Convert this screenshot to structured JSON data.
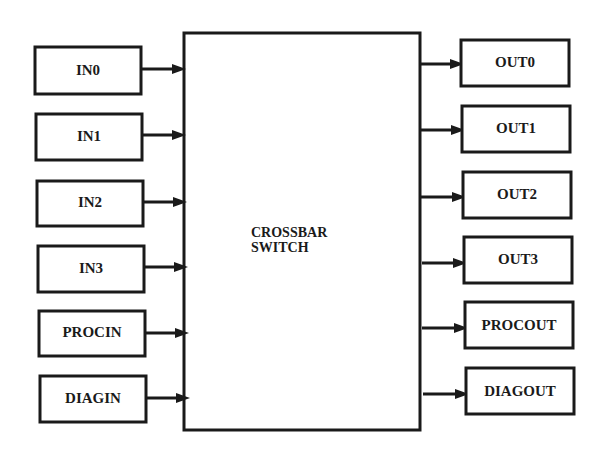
{
  "diagram": {
    "core": {
      "line1": "CROSSBAR",
      "line2": "SWITCH"
    },
    "inputs": [
      {
        "label": "IN0"
      },
      {
        "label": "IN1"
      },
      {
        "label": "IN2"
      },
      {
        "label": "IN3"
      },
      {
        "label": "PROCIN"
      },
      {
        "label": "DIAGIN"
      }
    ],
    "outputs": [
      {
        "label": "OUT0"
      },
      {
        "label": "OUT1"
      },
      {
        "label": "OUT2"
      },
      {
        "label": "OUT3"
      },
      {
        "label": "PROCOUT"
      },
      {
        "label": "DIAGOUT"
      }
    ],
    "colors": {
      "ink": "#1a1a1a",
      "background": "#ffffff"
    }
  }
}
